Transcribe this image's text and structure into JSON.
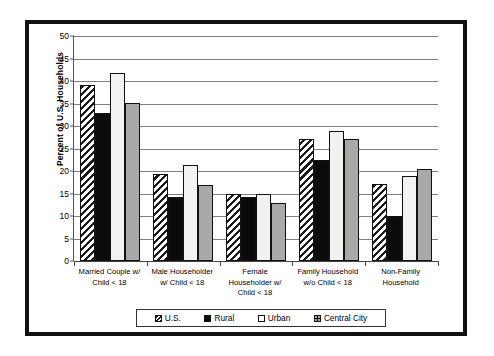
{
  "chart_data": {
    "type": "bar",
    "title": "",
    "xlabel": "",
    "ylabel": "Percent of U.S. Households",
    "ylim": [
      0,
      50
    ],
    "ytick_step": 5,
    "yticks": [
      0,
      5,
      10,
      15,
      20,
      25,
      30,
      35,
      40,
      45,
      50
    ],
    "ytick_labels": [
      "0",
      "5",
      "10",
      "15",
      "20",
      "25",
      "30",
      "35",
      "40",
      "45",
      "50"
    ],
    "grid": true,
    "legend_position": "bottom",
    "categories": [
      "Married Couple w/ Child < 18",
      "Male Householder w/ Child < 18",
      "Female Householder w/ Child < 18",
      "Family Household w/o Child < 18",
      "Non-Family Household"
    ],
    "category_lines": [
      [
        "Married Couple w/",
        "Child < 18"
      ],
      [
        "Male Householder",
        "w/ Child < 18"
      ],
      [
        "Female",
        "Householder w/",
        "Child < 18"
      ],
      [
        "Family Household",
        "w/o Child < 18"
      ],
      [
        "Non-Family",
        "Household"
      ]
    ],
    "series": [
      {
        "name": "U.S.",
        "fill": "diagonal-hatch",
        "color": "#ffffff",
        "values": [
          39.2,
          19.4,
          14.8,
          27.1,
          17.2
        ]
      },
      {
        "name": "Rural",
        "fill": "solid",
        "color": "#0b0b0b",
        "values": [
          33.0,
          14.2,
          14.3,
          22.4,
          10.0
        ]
      },
      {
        "name": "Urban",
        "fill": "solid",
        "color": "#f2f2f0",
        "values": [
          41.7,
          21.3,
          14.8,
          28.8,
          18.9
        ]
      },
      {
        "name": "Central City",
        "fill": "solid",
        "color": "#a9a9a9",
        "values": [
          35.2,
          16.9,
          12.8,
          27.2,
          20.5
        ]
      }
    ]
  },
  "legend": {
    "items": [
      {
        "label": "U.S."
      },
      {
        "label": "Rural"
      },
      {
        "label": "Urban"
      },
      {
        "label": "Central City"
      }
    ]
  }
}
